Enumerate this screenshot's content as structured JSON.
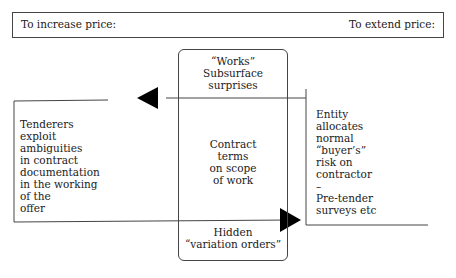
{
  "header": {
    "left_label": "To increase price:",
    "right_label": "To extend price:"
  },
  "center_box": {
    "top_lines": [
      "“Works”",
      "Subsurface",
      "surprises"
    ],
    "middle_lines": [
      "Contract",
      "terms",
      "on scope",
      "of work"
    ],
    "bottom_lines": [
      "Hidden",
      "“variation orders”"
    ]
  },
  "left_box": {
    "lines": [
      "Tenderers",
      "exploit",
      "ambiguities",
      "in contract",
      "documentation",
      "in the working",
      "of the",
      "offer"
    ]
  },
  "right_box": {
    "lines": [
      "Entity",
      "allocates",
      "normal",
      "“buyer’s”",
      "risk on",
      "contractor",
      "–",
      "Pre-tender",
      "surveys etc"
    ]
  },
  "arrows": [
    {
      "name": "arrow-to-increase",
      "direction": "left"
    },
    {
      "name": "arrow-to-extend",
      "direction": "right"
    }
  ],
  "colors": {
    "line": "#444444",
    "arrow": "#000000",
    "text": "#1a1a1a"
  }
}
